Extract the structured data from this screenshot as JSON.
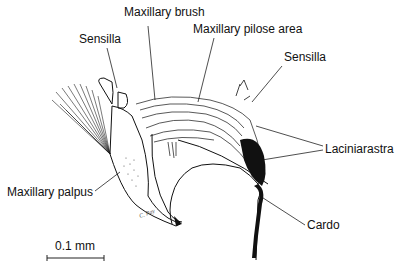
{
  "figure": {
    "type": "scientific-illustration",
    "signature": "C. Ray"
  },
  "labels": [
    {
      "id": "maxillary-brush",
      "text": "Maxillary brush"
    },
    {
      "id": "maxillary-pilose-area",
      "text": "Maxillary pilose area"
    },
    {
      "id": "sensilla-left",
      "text": "Sensilla"
    },
    {
      "id": "sensilla-right",
      "text": "Sensilla"
    },
    {
      "id": "laciniarastra",
      "text": "Laciniarastra"
    },
    {
      "id": "maxillary-palpus",
      "text": "Maxillary palpus"
    },
    {
      "id": "cardo",
      "text": "Cardo"
    }
  ],
  "scale_bar": {
    "label": "0.1 mm"
  },
  "colors": {
    "ink": "#111111",
    "background": "#ffffff"
  }
}
